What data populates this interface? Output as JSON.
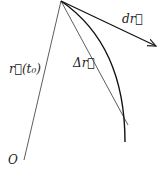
{
  "diagram": {
    "labels": {
      "origin": "O",
      "position": "r⃗(t₀)",
      "displacement": "Δr⃗",
      "differential": "dr⃗"
    },
    "colors": {
      "stroke": "#222222",
      "background": "#ffffff"
    }
  }
}
